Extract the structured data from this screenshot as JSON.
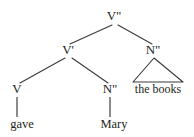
{
  "diagram": {
    "type": "syntax-tree",
    "background_color": "#ffffff",
    "line_color": "#3a3a3a",
    "text_color": "#231f20",
    "nodes": [
      {
        "id": "vmax",
        "label": "V\"",
        "x": 114,
        "y": 16,
        "kind": "category"
      },
      {
        "id": "vbar",
        "label": "V'",
        "x": 68,
        "y": 50,
        "kind": "category"
      },
      {
        "id": "nmax-right",
        "label": "N\"",
        "x": 153,
        "y": 50,
        "kind": "category"
      },
      {
        "id": "v-head",
        "label": "V",
        "x": 17,
        "y": 89,
        "kind": "category"
      },
      {
        "id": "nmax-obj",
        "label": "N\"",
        "x": 110,
        "y": 89,
        "kind": "category"
      },
      {
        "id": "leaf-gave",
        "label": "gave",
        "x": 22,
        "y": 124,
        "kind": "leaf"
      },
      {
        "id": "leaf-mary",
        "label": "Mary",
        "x": 114,
        "y": 124,
        "kind": "leaf"
      },
      {
        "id": "leaf-books",
        "label": "the books",
        "x": 158,
        "y": 88,
        "kind": "phrase"
      }
    ],
    "edges": [
      {
        "from": "vmax",
        "to": "vbar",
        "style": "branch-left"
      },
      {
        "from": "vmax",
        "to": "nmax-right",
        "style": "branch-right"
      },
      {
        "from": "vbar",
        "to": "v-head",
        "style": "branch-left"
      },
      {
        "from": "vbar",
        "to": "nmax-obj",
        "style": "branch-right"
      },
      {
        "from": "v-head",
        "to": "leaf-gave",
        "style": "vertical"
      },
      {
        "from": "nmax-obj",
        "to": "leaf-mary",
        "style": "vertical"
      },
      {
        "from": "nmax-right",
        "to": "leaf-books",
        "style": "triangle"
      }
    ],
    "sentence": "gave Mary the books"
  }
}
